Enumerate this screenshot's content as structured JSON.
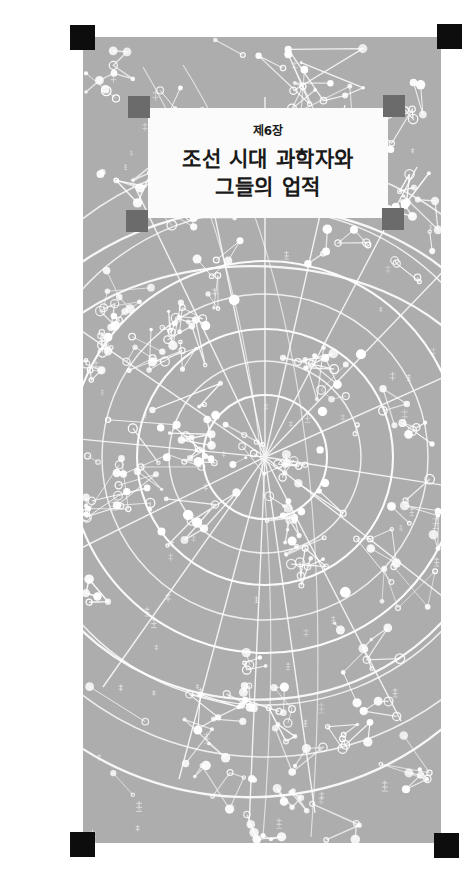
{
  "page": {
    "background_color": "#ffffff",
    "kind": "book-chapter-divider"
  },
  "star_panel": {
    "name": "korean-star-chart",
    "background_color": "#a9a9a9",
    "star_color": "#ffffff",
    "description": "Cheonsang Yeolcha Bunyajido style celestial map"
  },
  "registration_marks": {
    "color": "#0d0d0d",
    "positions": [
      "top-left",
      "top-right",
      "bottom-left",
      "bottom-right"
    ]
  },
  "title_block": {
    "plate_color": "#fbfbfb",
    "accent_color": "#6b6b6b",
    "chapter_number": "제6장",
    "title_line_1": "조선 시대 과학자와",
    "title_line_2": "그들의 업적"
  }
}
